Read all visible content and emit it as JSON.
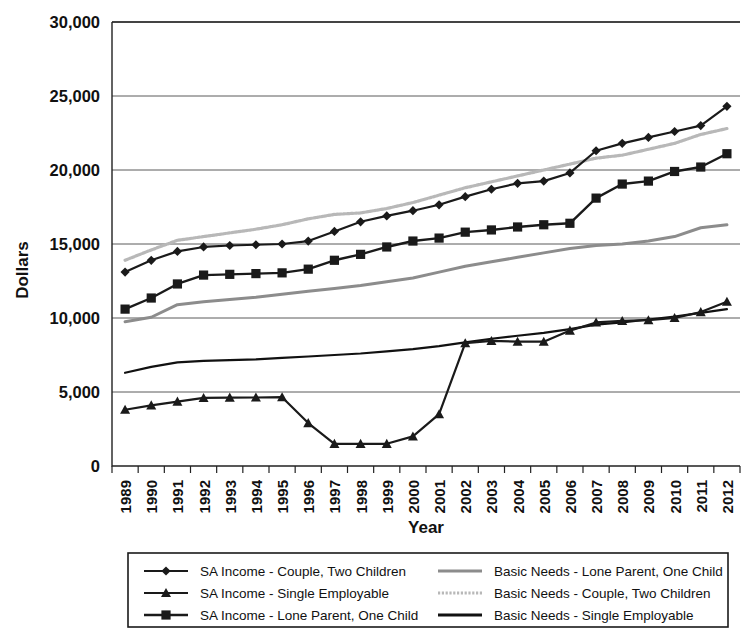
{
  "chart_data": {
    "type": "line",
    "title": "",
    "xlabel": "Year",
    "ylabel": "Dollars",
    "grid": true,
    "legend_position": "bottom",
    "ylim": [
      0,
      30000
    ],
    "ytick_labels": [
      "30,000",
      "25,000",
      "20,000",
      "15,000",
      "10,000",
      "5,000",
      "0"
    ],
    "ytick_values": [
      30000,
      25000,
      20000,
      15000,
      10000,
      5000,
      0
    ],
    "categories": [
      "1989",
      "1990",
      "1991",
      "1992",
      "1993",
      "1994",
      "1995",
      "1996",
      "1997",
      "1998",
      "1999",
      "2000",
      "2001",
      "2002",
      "2003",
      "2004",
      "2005",
      "2006",
      "2007",
      "2008",
      "2009",
      "2010",
      "2011",
      "2012"
    ],
    "series": [
      {
        "name": "SA Income - Couple, Two Children",
        "marker": "diamond",
        "line_style": "solid",
        "color": "#1a1a1a",
        "line_width": 2.2,
        "values": [
          13100,
          13900,
          14500,
          14800,
          14900,
          14950,
          15000,
          15200,
          15850,
          16500,
          16900,
          17250,
          17650,
          18200,
          18700,
          19100,
          19250,
          19800,
          21300,
          21800,
          22200,
          22600,
          23000,
          24300
        ]
      },
      {
        "name": "SA Income - Single Employable",
        "marker": "triangle",
        "line_style": "solid",
        "color": "#1a1a1a",
        "line_width": 2.2,
        "values": [
          3800,
          4100,
          4350,
          4600,
          4620,
          4630,
          4650,
          2900,
          1500,
          1500,
          1500,
          2000,
          3500,
          8300,
          8450,
          8400,
          8400,
          9150,
          9700,
          9800,
          9850,
          10000,
          10400,
          11100
        ]
      },
      {
        "name": "SA Income - Lone Parent, One Child",
        "marker": "square",
        "line_style": "solid",
        "color": "#1a1a1a",
        "line_width": 2.4,
        "values": [
          10600,
          11350,
          12300,
          12900,
          12950,
          13000,
          13050,
          13300,
          13900,
          14300,
          14800,
          15200,
          15400,
          15800,
          15950,
          16150,
          16300,
          16400,
          18100,
          19050,
          19250,
          19900,
          20200,
          21100
        ]
      },
      {
        "name": "Basic Needs - Lone Parent, One Child",
        "marker": "none",
        "line_style": "solid-grey",
        "color": "#8c8c8c",
        "line_width": 3.0,
        "values": [
          9750,
          10050,
          10900,
          11100,
          11250,
          11400,
          11600,
          11800,
          12000,
          12200,
          12450,
          12700,
          13100,
          13500,
          13800,
          14100,
          14400,
          14700,
          14900,
          15000,
          15200,
          15500,
          16100,
          16300
        ]
      },
      {
        "name": "Basic Needs - Couple, Two Children",
        "marker": "none",
        "line_style": "dotted-grey",
        "color": "#b8b8b8",
        "line_width": 3.2,
        "values": [
          13900,
          14600,
          15250,
          15500,
          15750,
          16000,
          16300,
          16700,
          17000,
          17100,
          17400,
          17800,
          18300,
          18800,
          19200,
          19600,
          20000,
          20400,
          20800,
          21000,
          21400,
          21800,
          22400,
          22800
        ]
      },
      {
        "name": "Basic Needs - Single Employable",
        "marker": "none",
        "line_style": "solid-black",
        "color": "#111111",
        "line_width": 2.2,
        "values": [
          6300,
          6700,
          7000,
          7100,
          7150,
          7200,
          7300,
          7400,
          7500,
          7600,
          7750,
          7900,
          8100,
          8350,
          8600,
          8800,
          9000,
          9250,
          9550,
          9700,
          9900,
          10100,
          10350,
          10600
        ]
      }
    ],
    "legend_columns": [
      [
        "SA Income - Couple, Two Children",
        "SA Income - Single Employable",
        "SA Income - Lone Parent, One Child"
      ],
      [
        "Basic Needs - Lone Parent, One Child",
        "Basic Needs - Couple, Two Children",
        "Basic Needs - Single Employable"
      ]
    ]
  }
}
